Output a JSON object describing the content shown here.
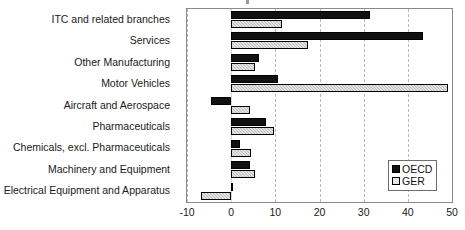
{
  "chart_data": {
    "type": "bar",
    "orientation": "horizontal",
    "title": "",
    "xlabel": "",
    "ylabel": "",
    "xlim": [
      -10,
      50
    ],
    "xticks": [
      -10,
      0,
      10,
      20,
      30,
      40,
      50
    ],
    "xtick_labels": [
      "-10",
      "0",
      "10",
      "20",
      "30",
      "40",
      "50"
    ],
    "grid": true,
    "grid_axis": "x",
    "grid_style": "dashed",
    "legend_position": "lower right",
    "categories": [
      "ITC and related branches",
      "Services",
      "Other Manufacturing",
      "Motor Vehicles",
      "Aircraft and Aerospace",
      "Pharmaceuticals",
      "Chemicals, excl. Pharmaceuticals",
      "Machinery and Equipment",
      "Electrical Equipment and Apparatus"
    ],
    "series": [
      {
        "name": "OECD",
        "color": "#111111",
        "values": [
          31.5,
          43.5,
          6.3,
          10.5,
          -4.6,
          7.8,
          2.1,
          4.2,
          0.5
        ]
      },
      {
        "name": "GER",
        "color": "#bdbdbd",
        "values": [
          11.6,
          17.5,
          5.5,
          49.0,
          4.2,
          9.7,
          4.6,
          5.3,
          -6.8
        ]
      }
    ]
  },
  "legend": {
    "entries": [
      {
        "label": "OECD",
        "swatch": "black-square-swatch"
      },
      {
        "label": "GER",
        "swatch": "light-gray-square-swatch"
      }
    ]
  }
}
